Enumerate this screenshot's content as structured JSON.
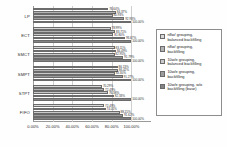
{
  "chart_data": {
    "type": "bar",
    "orientation": "horizontal",
    "title": "",
    "subtitle": "",
    "xlabel": "",
    "ylabel": "",
    "xlim": [
      0,
      1.2
    ],
    "grid": true,
    "legend_position": "right",
    "categories": [
      "LP",
      "ECT",
      "SMCT",
      "SMPT",
      "STPT",
      "FIFO"
    ],
    "xticks": [
      "0.00%",
      "20.00%",
      "40.00%",
      "60.00%",
      "80.00%",
      "100.00%"
    ],
    "xtick_values": [
      0,
      0.2,
      0.4,
      0.6,
      0.8,
      1.0
    ],
    "series": [
      {
        "name": "n8w/ grouping, balanced backfilling",
        "values": [
          0.7664,
          0.7899,
          0.8311,
          0.8613,
          0.7029,
          0.7249
        ]
      },
      {
        "name": "n8w/ grouping, backfilling",
        "values": [
          0.8437,
          0.8371,
          0.8449,
          0.8642,
          0.7249,
          0.7401
        ]
      },
      {
        "name": "10w/e grouping, balanced backfilling",
        "values": [
          0.8093,
          0.818,
          0.8295,
          0.833,
          0.7638,
          0.8815
        ]
      },
      {
        "name": "10w/e grouping, backfilling",
        "values": [
          0.9293,
          0.9367,
          0.9179,
          0.9127,
          0.8233,
          0.9162
        ]
      },
      {
        "name": "10w/e grouping, w/o backfilling (base)",
        "values": [
          1.0,
          1.0,
          1.0,
          1.0,
          1.0,
          1.0
        ]
      }
    ],
    "bar_labels": [
      [
        "76.64%",
        "84.37%",
        "80.93%",
        "92.93%",
        "100.00%"
      ],
      [
        "78.99%",
        "83.71%",
        "81.80%",
        "93.67%",
        "100.00%"
      ],
      [
        "83.11%",
        "84.49%",
        "82.95%",
        "91.79%",
        "100.00%"
      ],
      [
        "86.13%",
        "86.42%",
        "83.30%",
        "91.27%",
        "100.00%"
      ],
      [
        "70.29%",
        "72.49%",
        "76.38%",
        "82.33%",
        "100.00%"
      ],
      [
        "72.49%",
        "74.01%",
        "88.15%",
        "91.62%",
        "100.00%"
      ]
    ],
    "colors": {
      "series_0": "#d8d8d8",
      "series_1": "#b3b3b3",
      "series_2": "#cacaca",
      "series_3": "#9d9d9d",
      "series_4": "#848484",
      "axis": "#9a9a9a",
      "grid": "#cfcfcf",
      "text": "#2a2a2a",
      "background": "#ffffff"
    }
  },
  "legend": {
    "items": [
      {
        "label": "n8w/ grouping,\nbalanced backfilling"
      },
      {
        "label": "n8w/ grouping,\nbackfilling"
      },
      {
        "label": "10w/e grouping,\nbalanced backfilling"
      },
      {
        "label": "10w/e grouping,\nbackfilling"
      },
      {
        "label": "10w/e grouping, w/o\nbackfilling (base)"
      }
    ]
  }
}
